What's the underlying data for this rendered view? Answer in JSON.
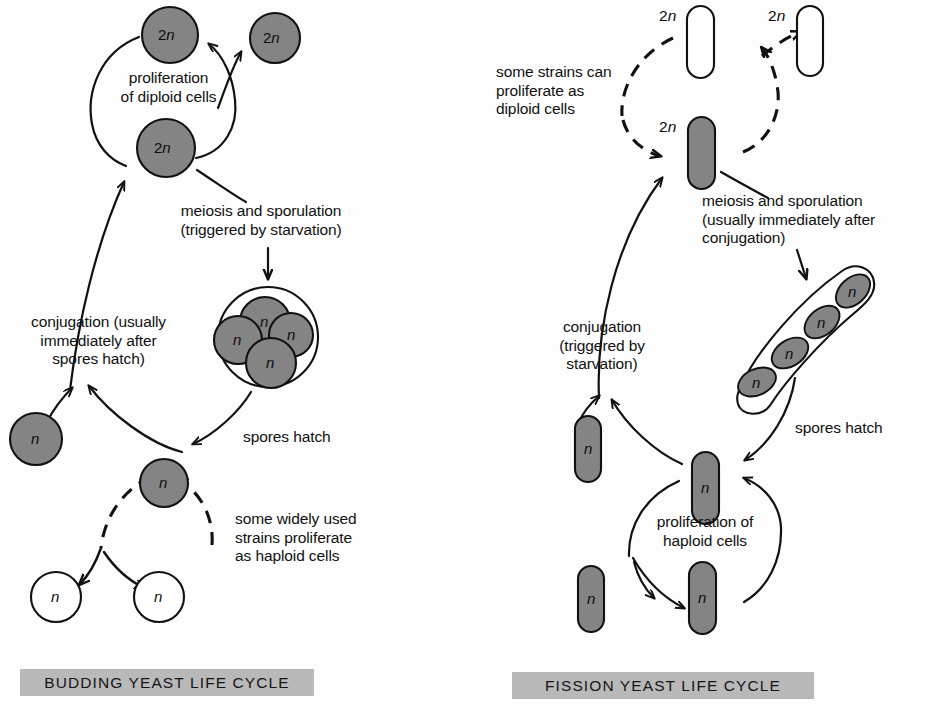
{
  "figure": {
    "background_color": "#fdfdfd",
    "cell_fill_gray": "#848484",
    "cell_fill_white": "#ffffff",
    "stroke_color": "#111111",
    "banner_color": "#b9b9b9"
  },
  "budding": {
    "banner_label": "BUDDING YEAST LIFE CYCLE",
    "captions": {
      "proliferation": "proliferation\nof diploid cells",
      "meiosis": "meiosis and sporulation\n(triggered by starvation)",
      "conjugation": "conjugation (usually\nimmediately after\nspores hatch)",
      "spores_hatch": "spores hatch",
      "haploid_strains": "some widely used\nstrains proliferate\nas haploid cells"
    },
    "cells": [
      {
        "name": "diploid-top",
        "ploidy_prefix": "2",
        "ploidy_italic": "n",
        "shape": "circle",
        "fill": "gray"
      },
      {
        "name": "diploid-bud",
        "ploidy_prefix": "2",
        "ploidy_italic": "n",
        "shape": "circle",
        "fill": "gray"
      },
      {
        "name": "diploid-bottom",
        "ploidy_prefix": "2",
        "ploidy_italic": "n",
        "shape": "circle",
        "fill": "gray"
      },
      {
        "name": "spore-1",
        "ploidy_prefix": "",
        "ploidy_italic": "n",
        "shape": "circle",
        "fill": "gray"
      },
      {
        "name": "spore-2",
        "ploidy_prefix": "",
        "ploidy_italic": "n",
        "shape": "circle",
        "fill": "gray"
      },
      {
        "name": "spore-3",
        "ploidy_prefix": "",
        "ploidy_italic": "n",
        "shape": "circle",
        "fill": "gray"
      },
      {
        "name": "spore-4",
        "ploidy_prefix": "",
        "ploidy_italic": "n",
        "shape": "circle",
        "fill": "gray"
      },
      {
        "name": "haploid-mate",
        "ploidy_prefix": "",
        "ploidy_italic": "n",
        "shape": "circle",
        "fill": "gray"
      },
      {
        "name": "haploid-hub",
        "ploidy_prefix": "",
        "ploidy_italic": "n",
        "shape": "circle",
        "fill": "gray"
      },
      {
        "name": "haploid-daughter-left",
        "ploidy_prefix": "",
        "ploidy_italic": "n",
        "shape": "circle",
        "fill": "white"
      },
      {
        "name": "haploid-daughter-right",
        "ploidy_prefix": "",
        "ploidy_italic": "n",
        "shape": "circle",
        "fill": "white"
      }
    ],
    "ascus_spore_count": 4
  },
  "fission": {
    "banner_label": "FISSION YEAST LIFE CYCLE",
    "captions": {
      "diploid_strains": "some strains can\nproliferate as\ndiploid cells",
      "meiosis": "meiosis and sporulation\n(usually immediately after\nconjugation)",
      "conjugation": "conjugation\n(triggered by\nstarvation)",
      "spores_hatch": "spores hatch",
      "proliferation": "proliferation of\nhaploid cells"
    },
    "cells": [
      {
        "name": "diploid-daughter-left",
        "ploidy_prefix": "2",
        "ploidy_italic": "n",
        "shape": "rod",
        "fill": "white",
        "label_outside": true
      },
      {
        "name": "diploid-daughter-right",
        "ploidy_prefix": "2",
        "ploidy_italic": "n",
        "shape": "rod",
        "fill": "white",
        "label_outside": true
      },
      {
        "name": "diploid-zygote",
        "ploidy_prefix": "2",
        "ploidy_italic": "n",
        "shape": "rod",
        "fill": "gray",
        "label_outside": true
      },
      {
        "name": "spore-1",
        "ploidy_prefix": "",
        "ploidy_italic": "n",
        "shape": "rod",
        "fill": "gray"
      },
      {
        "name": "spore-2",
        "ploidy_prefix": "",
        "ploidy_italic": "n",
        "shape": "rod",
        "fill": "gray"
      },
      {
        "name": "spore-3",
        "ploidy_prefix": "",
        "ploidy_italic": "n",
        "shape": "rod",
        "fill": "gray"
      },
      {
        "name": "spore-4",
        "ploidy_prefix": "",
        "ploidy_italic": "n",
        "shape": "rod",
        "fill": "gray"
      },
      {
        "name": "haploid-mate",
        "ploidy_prefix": "",
        "ploidy_italic": "n",
        "shape": "rod",
        "fill": "gray"
      },
      {
        "name": "haploid-hub",
        "ploidy_prefix": "",
        "ploidy_italic": "n",
        "shape": "rod",
        "fill": "gray"
      },
      {
        "name": "haploid-daughter-left",
        "ploidy_prefix": "",
        "ploidy_italic": "n",
        "shape": "rod",
        "fill": "gray"
      },
      {
        "name": "haploid-daughter-right",
        "ploidy_prefix": "",
        "ploidy_italic": "n",
        "shape": "rod",
        "fill": "gray"
      }
    ],
    "ascus_spore_count": 4
  }
}
